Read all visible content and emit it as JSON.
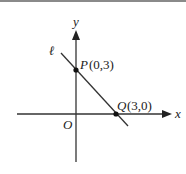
{
  "diagram": {
    "type": "coordinate-plane",
    "axes": {
      "x_label": "x",
      "y_label": "y",
      "origin_label": "O"
    },
    "line": {
      "label": "ℓ"
    },
    "points": [
      {
        "name": "P",
        "coords": "(0,3)"
      },
      {
        "name": "Q",
        "coords": "(3,0)"
      }
    ],
    "colors": {
      "stroke": "#333333",
      "border": "#8a8a8a"
    }
  }
}
